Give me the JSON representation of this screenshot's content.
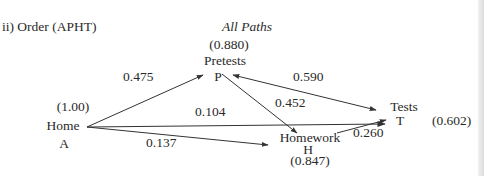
{
  "figure": {
    "panel_label": "ii) Order (APHT)",
    "subtitle": "All Paths"
  },
  "nodes": {
    "home": {
      "name": "Home",
      "letter": "A",
      "value": "(1.00)"
    },
    "pretests": {
      "name": "Pretests",
      "letter": "P",
      "value": "(0.880)"
    },
    "homework": {
      "name": "Homework",
      "letter": "H",
      "value": "(0.847)"
    },
    "tests": {
      "name": "Tests",
      "letter": "T",
      "value": "(0.602)"
    }
  },
  "paths": {
    "A_to_P": "0.475",
    "A_to_T": "0.104",
    "A_to_H": "0.137",
    "P_to_H": "0.452",
    "P_T": "0.590",
    "H_to_T": "0.260"
  },
  "colors": {
    "line": "#333333",
    "text": "#2a2a2a",
    "background": "#ffffff"
  }
}
